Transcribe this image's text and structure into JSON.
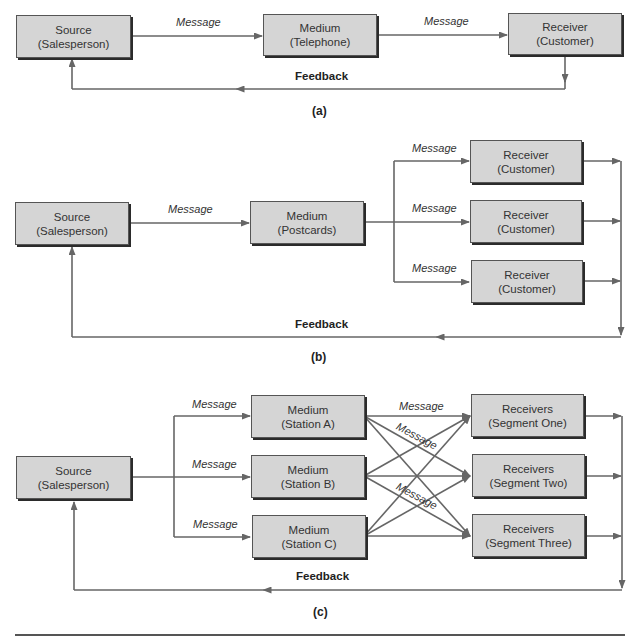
{
  "figure": {
    "panels": [
      {
        "caption": "(a)",
        "source": {
          "title": "Source",
          "subtitle": "(Salesperson)"
        },
        "medium": {
          "title": "Medium",
          "subtitle": "(Telephone)"
        },
        "receiver": {
          "title": "Receiver",
          "subtitle": "(Customer)"
        },
        "message_labels": [
          "Message",
          "Message"
        ],
        "feedback_label": "Feedback"
      },
      {
        "caption": "(b)",
        "source": {
          "title": "Source",
          "subtitle": "(Salesperson)"
        },
        "medium": {
          "title": "Medium",
          "subtitle": "(Postcards)"
        },
        "receivers": [
          {
            "title": "Receiver",
            "subtitle": "(Customer)"
          },
          {
            "title": "Receiver",
            "subtitle": "(Customer)"
          },
          {
            "title": "Receiver",
            "subtitle": "(Customer)"
          }
        ],
        "message_labels": [
          "Message",
          "Message",
          "Message",
          "Message"
        ],
        "feedback_label": "Feedback"
      },
      {
        "caption": "(c)",
        "source": {
          "title": "Source",
          "subtitle": "(Salesperson)"
        },
        "media": [
          {
            "title": "Medium",
            "subtitle": "(Station A)"
          },
          {
            "title": "Medium",
            "subtitle": "(Station B)"
          },
          {
            "title": "Medium",
            "subtitle": "(Station C)"
          }
        ],
        "receivers": [
          {
            "title": "Receivers",
            "subtitle": "(Segment One)"
          },
          {
            "title": "Receivers",
            "subtitle": "(Segment Two)"
          },
          {
            "title": "Receivers",
            "subtitle": "(Segment Three)"
          }
        ],
        "message_labels": [
          "Message",
          "Message",
          "Message",
          "Message",
          "Message",
          "Message"
        ],
        "feedback_label": "Feedback"
      }
    ],
    "colors": {
      "box_fill": "#d5d5d5",
      "box_border": "#555555",
      "line": "#666666"
    }
  }
}
